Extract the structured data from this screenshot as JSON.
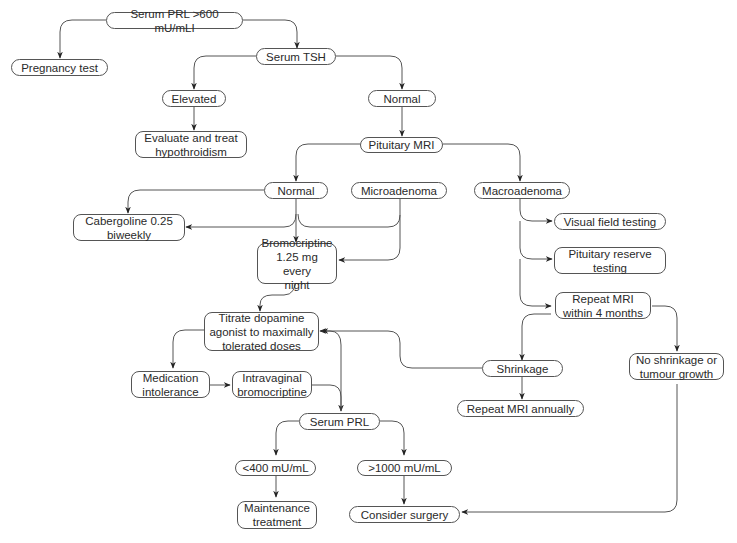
{
  "nodes": {
    "serum_prl_initial": "Serum PRL >600 mU/mLI",
    "pregnancy_test": "Pregnancy test",
    "serum_tsh": "Serum TSH",
    "elevated": "Elevated",
    "normal_tsh": "Normal",
    "evaluate_treat": "Evaluate and treat\nhypothroidism",
    "pituitary_mri": "Pituitary MRI",
    "normal_mri": "Normal",
    "microadenoma": "Microadenoma",
    "macroadenoma": "Macroadenoma",
    "cabergoline": "Cabergoline 0.25\nbiweekly",
    "bromocriptine": "Bromocriptine\n1.25 mg every\nnight",
    "visual_field": "Visual field testing",
    "pituitary_reserve": "Pituitary reserve\ntesting",
    "repeat_mri_4m": "Repeat MRI\nwithin 4 months",
    "titrate": "Titrate dopamine\nagonist to maximally\ntolerated doses",
    "med_intolerance": "Medication\nintolerance",
    "intravaginal": "Intravaginal\nbromocriptine",
    "shrinkage": "Shrinkage",
    "no_shrinkage": "No shrinkage or\ntumour growth",
    "repeat_mri_annual": "Repeat MRI annually",
    "serum_prl_followup": "Serum PRL",
    "lt400": "<400 mU/mL",
    "gt1000": ">1000 mU/mL",
    "maintenance": "Maintenance\ntreatment",
    "consider_surgery": "Consider surgery"
  },
  "colors": {
    "line": "#555555",
    "text": "#2a2a2a",
    "background": "#ffffff"
  }
}
